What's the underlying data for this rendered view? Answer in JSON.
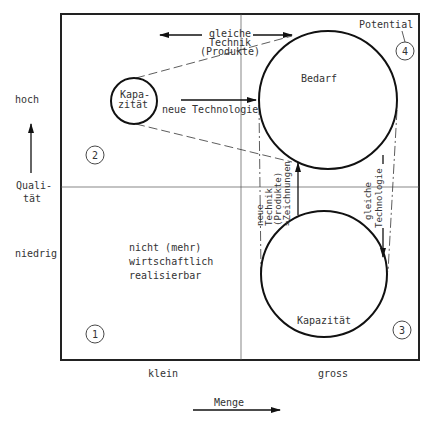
{
  "diagram": {
    "axes": {
      "y_axis": {
        "label_line1": "Quali-",
        "label_line2": "tät",
        "high": "hoch",
        "low": "niedrig"
      },
      "x_axis": {
        "label": "Menge",
        "small": "klein",
        "large": "gross"
      }
    },
    "quadrants": [
      {
        "number": "1",
        "text_line1": "nicht (mehr)",
        "text_line2": "wirtschaftlich",
        "text_line3": "realisierbar"
      },
      {
        "number": "2"
      },
      {
        "number": "3"
      },
      {
        "number": "4",
        "label": "Potential"
      }
    ],
    "circles": {
      "small_capacity": {
        "line1": "Kapa-",
        "line2": "zität"
      },
      "demand": {
        "label": "Bedarf"
      },
      "large_capacity": {
        "label": "Kapazität"
      }
    },
    "arrows": {
      "same_technique": {
        "line1": "gleiche",
        "line2": "Technik",
        "line3": "(Produkte)"
      },
      "new_technology": {
        "label": "neue Technologie"
      },
      "new_technique_drawings": {
        "line1": "neue",
        "line2": "Technik",
        "line3": "(Produkte)",
        "line4": "=Zeichnungen"
      },
      "same_technology": {
        "line1": "gleiche",
        "line2": "Technologie"
      }
    }
  }
}
